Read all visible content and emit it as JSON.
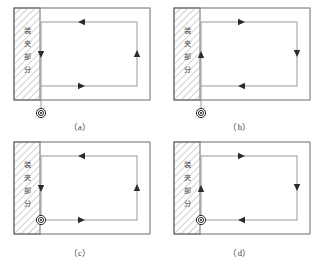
{
  "figure": {
    "type": "technical-diagram",
    "panels": [
      {
        "id": "a",
        "caption": "（a）",
        "clamp_label": "装夹部分",
        "clamp_label_chars": [
          "装",
          "夹",
          "部",
          "分"
        ],
        "entry_marker": "concentric-circle",
        "entry_position": "below-workpiece-outside",
        "lead_in": "vertical-line-from-bottom",
        "path_shape": "rectangle",
        "arrows": [
          {
            "edge": "top",
            "direction": "left"
          },
          {
            "edge": "right",
            "direction": "up"
          },
          {
            "edge": "bottom",
            "direction": "right"
          },
          {
            "edge": "left",
            "direction": "down"
          }
        ],
        "rotation": "counterclockwise"
      },
      {
        "id": "b",
        "caption": "（b）",
        "clamp_label": "装夹部分",
        "clamp_label_chars": [
          "装",
          "夹",
          "部",
          "分"
        ],
        "entry_marker": "concentric-circle",
        "entry_position": "below-workpiece-outside",
        "lead_in": "vertical-line-from-bottom",
        "path_shape": "rectangle",
        "arrows": [
          {
            "edge": "top",
            "direction": "right"
          },
          {
            "edge": "right",
            "direction": "down"
          },
          {
            "edge": "bottom",
            "direction": "left"
          },
          {
            "edge": "left",
            "direction": "up"
          }
        ],
        "rotation": "clockwise"
      },
      {
        "id": "c",
        "caption": "（c）",
        "clamp_label": "装夹部分",
        "clamp_label_chars": [
          "装",
          "夹",
          "部",
          "分"
        ],
        "entry_marker": "concentric-circle",
        "entry_position": "bottom-left-corner-of-path",
        "lead_in": "none",
        "path_shape": "rectangle",
        "arrows": [
          {
            "edge": "top",
            "direction": "left"
          },
          {
            "edge": "right",
            "direction": "up"
          },
          {
            "edge": "bottom",
            "direction": "right"
          },
          {
            "edge": "left",
            "direction": "down"
          }
        ],
        "rotation": "counterclockwise"
      },
      {
        "id": "d",
        "caption": "（d）",
        "clamp_label": "装夹部分",
        "clamp_label_chars": [
          "装",
          "夹",
          "部",
          "分"
        ],
        "entry_marker": "concentric-circle",
        "entry_position": "bottom-left-corner-of-path",
        "lead_in": "none",
        "path_shape": "rectangle",
        "arrows": [
          {
            "edge": "top",
            "direction": "right"
          },
          {
            "edge": "right",
            "direction": "down"
          },
          {
            "edge": "bottom",
            "direction": "left"
          },
          {
            "edge": "left",
            "direction": "up"
          }
        ],
        "rotation": "clockwise"
      }
    ],
    "colors": {
      "outline": "#6e6e6e",
      "path": "#9a9a9a",
      "hatch": "#8a8a8a",
      "marker": "#2b2b2b",
      "text": "#4a4a4a",
      "caption": "#3a3a3a",
      "background": "#ffffff"
    }
  }
}
